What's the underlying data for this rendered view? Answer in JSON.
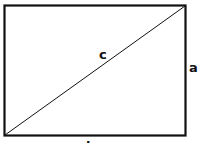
{
  "diagram": {
    "shape": "rectangle-with-diagonal",
    "labels": {
      "hypotenuse": "c",
      "height": "a",
      "width": "b"
    },
    "colors": {
      "stroke": "#111111",
      "background": "#ffffff"
    }
  }
}
